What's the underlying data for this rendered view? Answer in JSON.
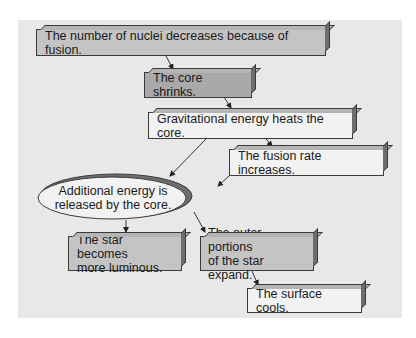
{
  "diagram": {
    "type": "flowchart",
    "nodes": [
      {
        "id": "n1",
        "label": "The number of nuclei decreases because of fusion.",
        "shape": "box",
        "fill": "#c4c4c4"
      },
      {
        "id": "n2",
        "label": "The core shrinks.",
        "shape": "box",
        "fill": "#a9a9a9"
      },
      {
        "id": "n3",
        "label": "Gravitational energy heats the core.",
        "shape": "box",
        "fill": "#f2f2f2"
      },
      {
        "id": "n4",
        "label": "The fusion rate increases.",
        "shape": "box",
        "fill": "#f2f2f2"
      },
      {
        "id": "n5",
        "label_line1": "Additional energy is",
        "label_line2": "released by the core.",
        "shape": "ellipse",
        "fill": "#f2f2f2"
      },
      {
        "id": "n6",
        "label_line1": "The star becomes",
        "label_line2": "more luminous.",
        "shape": "box",
        "fill": "#c4c4c4"
      },
      {
        "id": "n7",
        "label_line1": "The outer portions",
        "label_line2": "of the star expand.",
        "shape": "box",
        "fill": "#c4c4c4"
      },
      {
        "id": "n8",
        "label": "The surface cools.",
        "shape": "box",
        "fill": "#f2f2f2"
      }
    ],
    "edges": [
      {
        "from": "n1",
        "to": "n2"
      },
      {
        "from": "n2",
        "to": "n3"
      },
      {
        "from": "n3",
        "to": "n4"
      },
      {
        "from": "n3",
        "to": "n5"
      },
      {
        "from": "n4",
        "to": "n5"
      },
      {
        "from": "n5",
        "to": "n6"
      },
      {
        "from": "n5",
        "to": "n7"
      },
      {
        "from": "n7",
        "to": "n8"
      }
    ],
    "colors": {
      "panel_background": "#e8e8e8",
      "outline": "#3a3a3a"
    }
  }
}
